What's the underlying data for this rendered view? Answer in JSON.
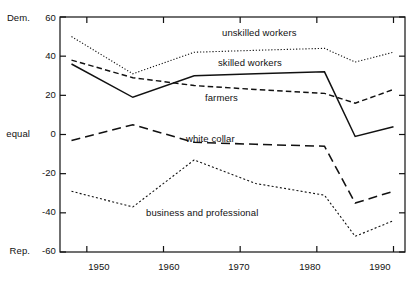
{
  "chart_data": {
    "type": "line",
    "title": "",
    "subtitle": "",
    "xlabel": "",
    "ylabel": "",
    "xlim": [
      1946.5,
      1991.5
    ],
    "ylim": [
      -60,
      60
    ],
    "grid": false,
    "legend_position": "inline-labels",
    "x_ticks": [
      "1950",
      "1960",
      "1970",
      "1980",
      "1990"
    ],
    "x_tick_values": [
      1950,
      1960,
      1970,
      1980,
      1990
    ],
    "y_ticks": [
      "60",
      "40",
      "20",
      "0",
      "-20",
      "-40",
      "-60"
    ],
    "y_tick_values": [
      60,
      40,
      20,
      0,
      -20,
      -40,
      -60
    ],
    "y_axis_top_note": "Dem.",
    "y_axis_zero_note": "equal",
    "y_axis_bottom_note": "Rep.",
    "x": [
      1948,
      1956,
      1964,
      1972,
      1981,
      1985,
      1990
    ],
    "series": [
      {
        "name": "unskilled workers",
        "style": "dotted",
        "values": [
          50,
          31,
          42,
          43,
          44,
          37,
          42
        ],
        "label_x": 1972,
        "label_y": 52
      },
      {
        "name": "skilled workers",
        "style": "solid",
        "values": [
          36,
          19,
          30,
          31,
          32,
          -1,
          4
        ],
        "label_x": 1971,
        "label_y": 37
      },
      {
        "name": "farmers",
        "style": "dashed",
        "values": [
          38,
          29,
          25,
          23,
          21,
          16,
          23
        ],
        "label_x": 1968,
        "label_y": 24
      },
      {
        "name": "white collar",
        "style": "longdash",
        "values": [
          -3,
          5,
          -4,
          -5,
          -6,
          -35,
          -29
        ],
        "label_x": 1967,
        "label_y": 0
      },
      {
        "name": "business and professional",
        "style": "finedot",
        "values": [
          -29,
          -37,
          -13,
          -25,
          -31,
          -52,
          -44
        ],
        "label_x": 1964,
        "label_y": -37
      }
    ]
  }
}
